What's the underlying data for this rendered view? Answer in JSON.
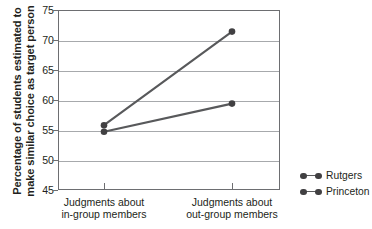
{
  "chart_data": {
    "type": "line",
    "title": "",
    "xlabel": "",
    "ylabel": "Percentage of students estimated to make similar choice as target person",
    "ylabel_line1": "Percentage of students estimated to",
    "ylabel_line2": "make similar choice as target person",
    "categories": [
      "Judgments about in-group members",
      "Judgments about out-group members"
    ],
    "category_lines": [
      [
        "Judgments about",
        "in-group members"
      ],
      [
        "Judgments about",
        "out-group members"
      ]
    ],
    "series": [
      {
        "name": "Rutgers",
        "values": [
          55.8,
          71.4
        ],
        "color": "#58595b"
      },
      {
        "name": "Princeton",
        "values": [
          54.7,
          59.4
        ],
        "color": "#58595b"
      }
    ],
    "ylim": [
      45,
      75
    ],
    "yticks": [
      75,
      70,
      65,
      60,
      55,
      50,
      45
    ],
    "ytick_labels": [
      "75",
      "70",
      "65",
      "60",
      "55",
      "50",
      "45"
    ],
    "grid": true,
    "legend_position": "right",
    "legend_entries": [
      "Rutgers",
      "Princeton"
    ],
    "marker": "circle",
    "axis_color": "#6d6e71",
    "grid_color": "#a7a9ac",
    "line_color": "#58595b",
    "marker_color": "#414042",
    "background": "#ffffff"
  }
}
